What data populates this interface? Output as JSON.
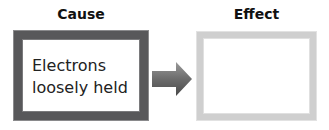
{
  "diagram": {
    "cause": {
      "heading": "Cause",
      "text_line1": "Electrons",
      "text_line2": "loosely held",
      "border_color": "#58585a"
    },
    "effect": {
      "heading": "Effect",
      "text": "",
      "border_color": "#cfcfcf"
    },
    "connector": {
      "icon": "right-arrow-icon",
      "color": "#6a6a6a"
    }
  }
}
